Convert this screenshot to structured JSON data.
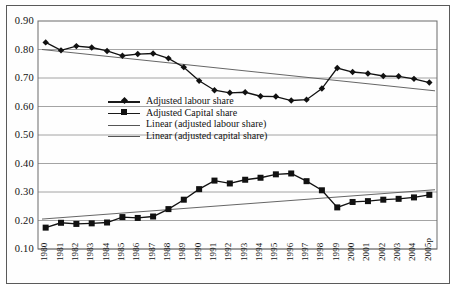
{
  "chart": {
    "type": "line",
    "plot_area": {
      "left": 38,
      "top": 21,
      "right": 437,
      "bottom": 249
    },
    "background": "#ffffff",
    "frame_color": "#5a5a5a",
    "grid": true,
    "grid_color": "#8d8d8d",
    "series_color": "#111111",
    "trend_color": "#555555"
  },
  "chart_data": {
    "type": "line",
    "title": "",
    "xlabel": "",
    "ylabel": "",
    "ylim": [
      0.1,
      0.9
    ],
    "ytick_step": 0.1,
    "grid": true,
    "legend_position": "inside-center-left",
    "categories": [
      "1980",
      "1981",
      "1982",
      "1983",
      "1984",
      "1985",
      "1986",
      "1987",
      "1988",
      "1989",
      "1990",
      "1991",
      "1992",
      "1993",
      "1994",
      "1995",
      "1996",
      "1997",
      "1998",
      "1999",
      "2000",
      "2001",
      "2002",
      "2003",
      "2004",
      "2005p"
    ],
    "yticks": [
      "0.90",
      "0.80",
      "0.70",
      "0.60",
      "0.50",
      "0.40",
      "0.30",
      "0.20",
      "0.10"
    ],
    "series": [
      {
        "name": "Adjusted labour share",
        "marker": "diamond",
        "values": [
          0.825,
          0.797,
          0.812,
          0.807,
          0.795,
          0.778,
          0.784,
          0.786,
          0.769,
          0.738,
          0.69,
          0.657,
          0.648,
          0.65,
          0.636,
          0.635,
          0.621,
          0.624,
          0.663,
          0.735,
          0.721,
          0.716,
          0.707,
          0.706,
          0.697,
          0.684
        ]
      },
      {
        "name": "Adjusted Capital share",
        "marker": "square",
        "values": [
          0.175,
          0.192,
          0.188,
          0.19,
          0.193,
          0.212,
          0.209,
          0.214,
          0.24,
          0.273,
          0.31,
          0.34,
          0.33,
          0.343,
          0.35,
          0.362,
          0.365,
          0.338,
          0.306,
          0.246,
          0.265,
          0.268,
          0.273,
          0.276,
          0.281,
          0.29
        ]
      }
    ],
    "trendlines": [
      {
        "name": "Linear (adjusted labour share)",
        "y_start": 0.8,
        "y_end": 0.655
      },
      {
        "name": "Linear (adjusted capital share)",
        "y_start": 0.205,
        "y_end": 0.308
      }
    ]
  },
  "legend": {
    "items": [
      {
        "label": "Adjusted labour share",
        "type": "marker-line",
        "marker": "diamond"
      },
      {
        "label": "Adjusted Capital share",
        "type": "marker-line",
        "marker": "square"
      },
      {
        "label": "Linear (adjusted labour share)",
        "type": "line"
      },
      {
        "label": "Linear (adjusted capital share)",
        "type": "line"
      }
    ]
  }
}
